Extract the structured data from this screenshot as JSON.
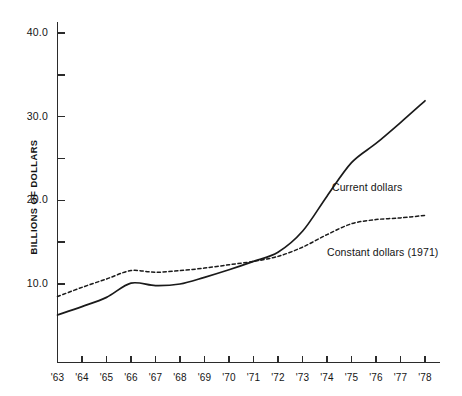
{
  "chart_data": {
    "type": "line",
    "title": "",
    "subtitle": "",
    "xlabel": "",
    "ylabel": "BILLIONS OF DOLLARS",
    "x": [
      "'63",
      "'64",
      "'65",
      "'66",
      "'67",
      "'68",
      "'69",
      "'70",
      "'71",
      "'72",
      "'73",
      "'74",
      "'75",
      "'76",
      "'77",
      "'78"
    ],
    "categories": [
      "'63",
      "'64",
      "'65",
      "'66",
      "'67",
      "'68",
      "'69",
      "'70",
      "'71",
      "'72",
      "'73",
      "'74",
      "'75",
      "'76",
      "'77",
      "'78"
    ],
    "series": [
      {
        "name": "Current dollars",
        "style": "solid",
        "values": [
          6.3,
          7.3,
          8.4,
          10.1,
          9.8,
          10.0,
          10.8,
          11.7,
          12.7,
          13.8,
          16.3,
          20.5,
          24.5,
          26.8,
          29.3,
          31.9
        ]
      },
      {
        "name": "Constant dollars (1971)",
        "style": "dashed",
        "values": [
          8.5,
          9.6,
          10.6,
          11.6,
          11.4,
          11.6,
          11.9,
          12.3,
          12.7,
          13.3,
          14.4,
          15.9,
          17.2,
          17.7,
          17.9,
          18.2
        ]
      }
    ],
    "ylim": [
      0.0,
      43.0
    ],
    "ytick_labels": [
      "40.0",
      "30.0",
      "20.0",
      "10.0"
    ],
    "ytick_values": [
      40.0,
      30.0,
      20.0,
      10.0
    ],
    "yminor_values": [
      35.0,
      25.0,
      15.0
    ],
    "grid": false,
    "legend_position": "inline-annotations",
    "annotations": [
      {
        "text": "Current dollars",
        "series": "Current dollars"
      },
      {
        "text": "Constant dollars (1971)",
        "series": "Constant dollars (1971)"
      }
    ],
    "line_color": "#1a1a1a",
    "axis_color": "#2b2b2b",
    "background_color": "#ffffff"
  },
  "axis": {
    "y_title": "BILLIONS OF DOLLARS",
    "y_labels": [
      "40.0",
      "30.0",
      "20.0",
      "10.0"
    ],
    "x_labels": [
      "'63",
      "'64",
      "'65",
      "'66",
      "'67",
      "'68",
      "'69",
      "'70",
      "'71",
      "'72",
      "'73",
      "'74",
      "'75",
      "'76",
      "'77",
      "'78"
    ]
  },
  "annotations": {
    "current": "Current dollars",
    "constant": "Constant dollars (1971)"
  }
}
